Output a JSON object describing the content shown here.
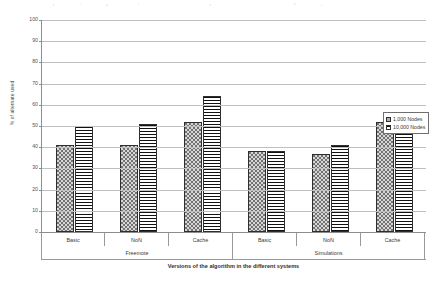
{
  "chart_data": {
    "type": "bar",
    "title": "",
    "xlabel": "Versions of the algorithm in the different systems",
    "ylabel": "% of alternate used",
    "ylim": [
      0,
      100
    ],
    "yticks": [
      0,
      10,
      20,
      30,
      40,
      50,
      60,
      70,
      80,
      90,
      100
    ],
    "grid": true,
    "legend_position": "right",
    "categories": [
      "Basic",
      "NoN",
      "Cache",
      "Basic",
      "NoN",
      "Cache"
    ],
    "groups": [
      {
        "label": "Freemote",
        "categories": [
          "Basic",
          "NoN",
          "Cache"
        ]
      },
      {
        "label": "Simulations",
        "categories": [
          "Basic",
          "NoN",
          "Cache"
        ]
      }
    ],
    "series": [
      {
        "name": "1,000 Nodes",
        "values": [
          41,
          41,
          52,
          38,
          37,
          52
        ]
      },
      {
        "name": "10,000 Nodes",
        "values": [
          50,
          51,
          64,
          38,
          41,
          51
        ]
      }
    ]
  },
  "legend": {
    "items": [
      {
        "label": "1,000 Nodes"
      },
      {
        "label": "10,000 Nodes"
      }
    ]
  }
}
